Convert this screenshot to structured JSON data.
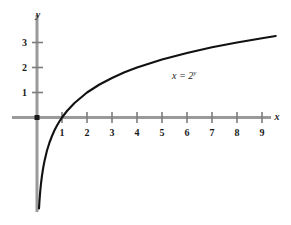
{
  "chart_data": {
    "type": "line",
    "title": "",
    "subtitle": "",
    "xlabel": "x",
    "ylabel": "y",
    "equation_label": "x = 2",
    "equation_exponent": "y",
    "function": "y = log2(x)",
    "xlim": [
      -0.35,
      10.15
    ],
    "ylim": [
      -3.75,
      4.35
    ],
    "grid": false,
    "legend_position": "inline-annotation",
    "x_tick_labels": [
      "1",
      "2",
      "3",
      "4",
      "5",
      "6",
      "7",
      "8",
      "9"
    ],
    "x_tick_values": [
      1,
      2,
      3,
      4,
      5,
      6,
      7,
      8,
      9
    ],
    "y_tick_labels": [
      "1",
      "2",
      "3"
    ],
    "y_tick_values": [
      1,
      2,
      3
    ],
    "origin_marker": true,
    "x": [
      0.08,
      0.1,
      0.13,
      0.16,
      0.2,
      0.25,
      0.3,
      0.4,
      0.5,
      0.6,
      0.7,
      0.8,
      0.9,
      1.0,
      1.2,
      1.5,
      2.0,
      2.5,
      3.0,
      3.5,
      4.0,
      5.0,
      6.0,
      7.0,
      8.0,
      9.0,
      9.55
    ],
    "values": [
      -3.64,
      -3.32,
      -2.94,
      -2.64,
      -2.32,
      -2.0,
      -1.74,
      -1.32,
      -1.0,
      -0.74,
      -0.51,
      -0.32,
      -0.15,
      0.0,
      0.26,
      0.58,
      1.0,
      1.32,
      1.58,
      1.81,
      2.0,
      2.32,
      2.58,
      2.81,
      3.0,
      3.17,
      3.26
    ],
    "colors": {
      "curve": "#111111",
      "axis": "#9a9a9a",
      "tick": "#7d7d7d",
      "text": "#1a1a1a",
      "background": "#ffffff"
    }
  }
}
